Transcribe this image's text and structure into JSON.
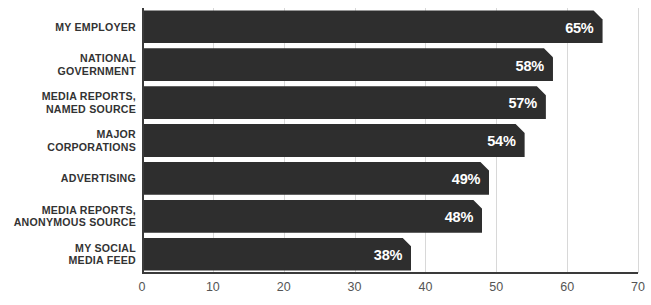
{
  "chart_data": {
    "type": "bar",
    "orientation": "horizontal",
    "title": "",
    "subtitle": "",
    "xlabel": "",
    "ylabel": "",
    "xlim": [
      0,
      70
    ],
    "xticks": [
      0,
      10,
      20,
      30,
      40,
      50,
      60,
      70
    ],
    "xtick_labels": [
      "0",
      "10",
      "20",
      "30",
      "40",
      "50",
      "60",
      "70"
    ],
    "grid": true,
    "legend": false,
    "legend_position": "none",
    "value_label_suffix": "%",
    "categories": [
      "MY EMPLOYER",
      "NATIONAL GOVERNMENT",
      "MEDIA REPORTS, NAMED SOURCE",
      "MAJOR CORPORATIONS",
      "ADVERTISING",
      "MEDIA REPORTS, ANONYMOUS SOURCE",
      "MY SOCIAL MEDIA FEED"
    ],
    "values": [
      65,
      58,
      57,
      54,
      49,
      48,
      38
    ],
    "value_labels": [
      "65%",
      "58%",
      "57%",
      "54%",
      "49%",
      "48%",
      "38%"
    ],
    "category_lines": [
      [
        "MY EMPLOYER"
      ],
      [
        "NATIONAL",
        "GOVERNMENT"
      ],
      [
        "MEDIA REPORTS,",
        "NAMED SOURCE"
      ],
      [
        "MAJOR",
        "CORPORATIONS"
      ],
      [
        "ADVERTISING"
      ],
      [
        "MEDIA REPORTS,",
        "ANONYMOUS SOURCE"
      ],
      [
        "MY SOCIAL",
        "MEDIA FEED"
      ]
    ]
  },
  "colors": {
    "bar_fill": "#2e2e2e",
    "value_label": "#ffffff",
    "category_label": "#333333",
    "tick_label": "#555555",
    "gridline": "#d8d8d8",
    "axis_line": "#3a3a3a",
    "background": "#ffffff"
  }
}
